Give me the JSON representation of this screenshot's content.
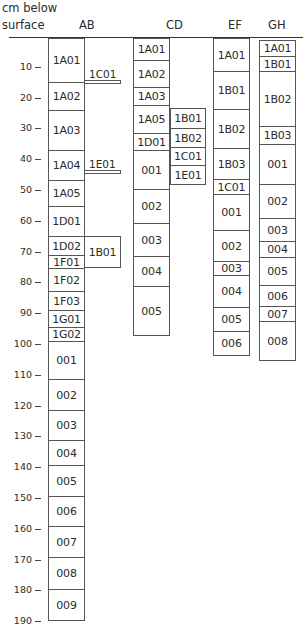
{
  "header": {
    "axis_title_line1": "cm below",
    "axis_title_line2": "surface",
    "columns": [
      "AB",
      "CD",
      "EF",
      "GH"
    ]
  },
  "axis": {
    "unit": "cm",
    "ticks": [
      "10",
      "20",
      "30",
      "40",
      "50",
      "60",
      "70",
      "80",
      "90",
      "100",
      "110",
      "120",
      "130",
      "140",
      "150",
      "160",
      "170",
      "180",
      "190"
    ]
  },
  "AB": {
    "main": [
      "1A01",
      "1A02",
      "1A03",
      "1A04",
      "1A05",
      "1D01",
      "1D02",
      "1F01",
      "1F02",
      "1F03",
      "1G01",
      "1G02",
      "001",
      "002",
      "003",
      "004",
      "005",
      "006",
      "007",
      "008",
      "009"
    ],
    "side": [
      "1C01",
      "1E01",
      "1B01"
    ]
  },
  "CD": {
    "main": [
      "1A01",
      "1A02",
      "1A03",
      "1A05",
      "1D01",
      "001",
      "002",
      "003",
      "004",
      "005"
    ],
    "side": [
      "1B01",
      "1B02",
      "1C01",
      "1E01"
    ]
  },
  "EF": {
    "main": [
      "1A01",
      "1B01",
      "1B02",
      "1B03",
      "1C01",
      "001",
      "002",
      "003",
      "004",
      "005",
      "006"
    ]
  },
  "GH": {
    "main": [
      "1A01",
      "1B01",
      "1B02",
      "1B03",
      "001",
      "002",
      "003",
      "004",
      "005",
      "006",
      "007",
      "008"
    ]
  },
  "chart_data": {
    "type": "diagram",
    "ylabel": "cm below surface",
    "ylim": [
      0,
      190
    ],
    "columns": [
      "AB",
      "CD",
      "EF",
      "GH"
    ]
  }
}
